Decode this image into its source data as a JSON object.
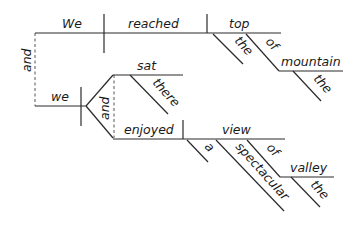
{
  "diagram": {
    "type": "sentence-diagram",
    "style": "Reed-Kellogg",
    "conjunction_main": "and",
    "clause1": {
      "subject": "We",
      "verb": "reached",
      "object": "top",
      "object_modifiers": {
        "article": "the",
        "preposition": "of",
        "prep_object": "mountain",
        "prep_object_article": "the"
      }
    },
    "clause2": {
      "subject": "we",
      "verb_conjunction": "and",
      "verb1": "sat",
      "verb1_adverb": "there",
      "verb2": "enjoyed",
      "object": "view",
      "object_modifiers": {
        "article": "a",
        "adjective": "spectacular",
        "preposition": "of",
        "prep_object": "valley",
        "prep_object_article": "the"
      }
    },
    "colors": {
      "line": "#2a2a2a",
      "text": "#1a1a1a",
      "background": "#ffffff"
    }
  }
}
